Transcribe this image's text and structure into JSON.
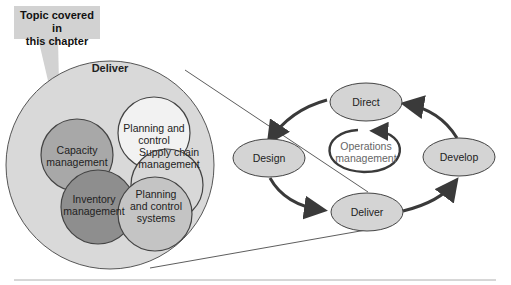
{
  "callout": {
    "line1": "Topic covered in",
    "line2": "this chapter"
  },
  "zoom_circle": {
    "title": "Deliver",
    "circles": [
      {
        "id": "planning-control",
        "line1": "Planning and",
        "line2": "control",
        "fill": "#f2f2f2"
      },
      {
        "id": "capacity",
        "line1": "Capacity",
        "line2": "management",
        "fill": "#a8a8a8"
      },
      {
        "id": "supply-chain",
        "line1": "Supply chain",
        "line2": "management",
        "fill": "#d8d8d8"
      },
      {
        "id": "inventory",
        "line1": "Inventory",
        "line2": "management",
        "fill": "#8e8e8e"
      },
      {
        "id": "planning-systems",
        "line1": "Planning",
        "line2": "and control",
        "line3": "systems",
        "fill": "#c4c4c4"
      }
    ]
  },
  "cycle": {
    "nodes": [
      {
        "id": "direct",
        "label": "Direct"
      },
      {
        "id": "design",
        "label": "Design"
      },
      {
        "id": "develop",
        "label": "Develop"
      },
      {
        "id": "deliver",
        "label": "Deliver"
      }
    ],
    "center": {
      "line1": "Operations",
      "line2": "management"
    }
  },
  "colors": {
    "outer_circle": "#d9d9d9",
    "node_fill": "#d4d4d4",
    "arrow": "#3a3a3a",
    "callout_bg": "#d2d2d2"
  }
}
